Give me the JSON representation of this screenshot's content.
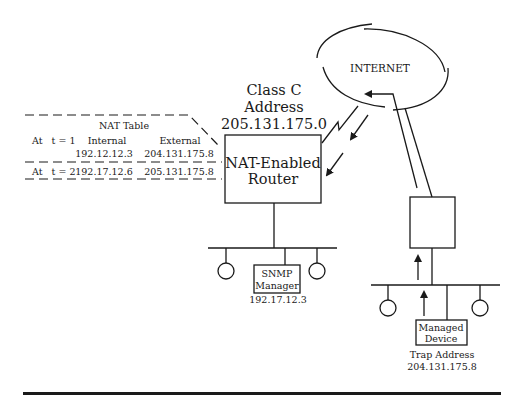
{
  "internet": {
    "label": "INTERNET"
  },
  "class_c": {
    "line1": "Class C",
    "line2": "Address",
    "line3": "205.131.175.0"
  },
  "router": {
    "line1": "NAT-Enabled",
    "line2": "Router"
  },
  "nat_table": {
    "title": "NAT Table",
    "headers": {
      "internal": "Internal",
      "external": "External"
    },
    "rows": [
      {
        "time": "At   t = 1",
        "internal": "192.12.12.3",
        "external": "204.131.175.8"
      },
      {
        "time": "At   t = 2",
        "internal": "192.17.12.6",
        "external": "205.131.175.8"
      }
    ]
  },
  "snmp_manager": {
    "line1": "SNMP",
    "line2": "Manager",
    "address": "192.17.12.3"
  },
  "managed_device": {
    "line1": "Managed",
    "line2": "Device",
    "trap_label": "Trap Address",
    "trap_address": "204.131.175.8"
  },
  "colors": {
    "ink": "#1a1a1a",
    "background": "#ffffff"
  }
}
